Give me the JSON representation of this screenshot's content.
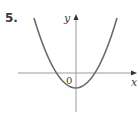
{
  "figure": {
    "problem_number": "5.",
    "x_axis_label": "x",
    "y_axis_label": "y",
    "origin_label": "0",
    "colors": {
      "axis": "#9a9a9a",
      "curve": "#6b6b6b",
      "text": "#444444",
      "background": "#ffffff"
    },
    "curve": {
      "type": "parabola",
      "opens": "up",
      "vertex": "below origin on y-axis",
      "x_intercepts": "one negative, one positive"
    }
  }
}
